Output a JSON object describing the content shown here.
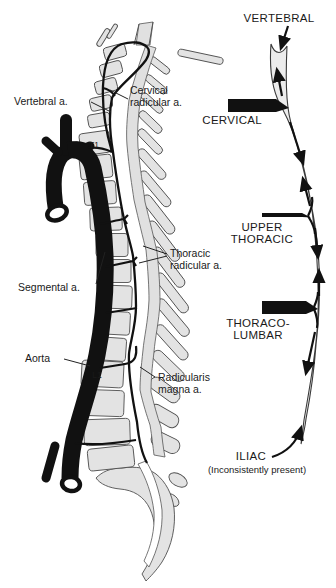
{
  "figure": {
    "colors": {
      "background": "#ffffff",
      "artery_black": "#111111",
      "bone_fill": "#e3e3e3",
      "bone_stroke": "#4f4f4f",
      "vessel_fill": "#ececec",
      "label_text": "#1a1a1a"
    }
  },
  "anatomy": {
    "labels": {
      "vertebral_a": "Vertebral a.",
      "cervical_radicular_line1": "Cervical",
      "cervical_radicular_line2": "radicular a.",
      "thoracic_radicular_line1": "Thoracic",
      "thoracic_radicular_line2": "radicular a.",
      "segmental_a": "Segmental a.",
      "aorta": "Aorta",
      "radicularis_magna_line1": "Radicularis",
      "radicularis_magna_line2": "magna a.",
      "t1": "T1",
      "l1": "L1"
    }
  },
  "schematic": {
    "labels": {
      "vertebral": "VERTEBRAL",
      "cervical": "CERVICAL",
      "upper_thoracic_line1": "UPPER",
      "upper_thoracic_line2": "THORACIC",
      "thoraco_lumbar_line1": "THORACO-",
      "thoraco_lumbar_line2": "LUMBAR",
      "iliac": "ILIAC",
      "iliac_note": "(Inconsistently present)"
    },
    "feeder_bars": [
      {
        "name": "cervical",
        "thickness": "thick"
      },
      {
        "name": "upper thoracic",
        "thickness": "thin"
      },
      {
        "name": "thoraco-lumbar",
        "thickness": "thickest"
      }
    ],
    "flow_arrows": [
      "down-from-vertebral",
      "up-to-cervical",
      "down-from-cervical",
      "up-to-upper-thoracic",
      "down-from-upper-thoracic",
      "up-to-thoraco-lumbar",
      "down-from-thoraco-lumbar",
      "up-from-iliac"
    ]
  }
}
